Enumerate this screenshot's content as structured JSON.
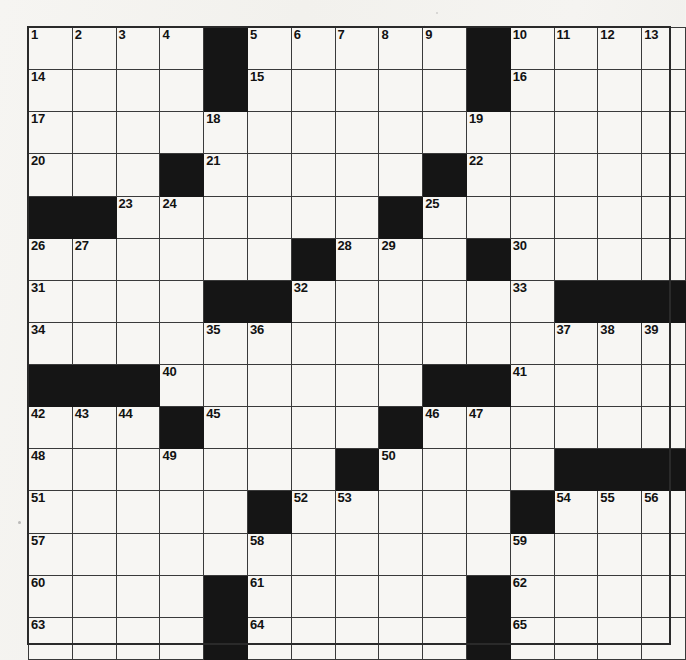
{
  "puzzle": {
    "title": "Crossword Puzzle Grid",
    "rows": 15,
    "columns": 15,
    "cell_fill_color": "#f7f6f3",
    "block_color": "#151515",
    "grid_line_color": "#3a3a3a",
    "number_color": "#121212",
    "paper_color": "#f2f1ed",
    "max_clue_number": 65,
    "grid": [
      [
        {
          "type": "open",
          "number": "1"
        },
        {
          "type": "open",
          "number": "2"
        },
        {
          "type": "open",
          "number": "3"
        },
        {
          "type": "open",
          "number": "4"
        },
        {
          "type": "block",
          "number": ""
        },
        {
          "type": "open",
          "number": "5"
        },
        {
          "type": "open",
          "number": "6"
        },
        {
          "type": "open",
          "number": "7"
        },
        {
          "type": "open",
          "number": "8"
        },
        {
          "type": "open",
          "number": "9"
        },
        {
          "type": "block",
          "number": ""
        },
        {
          "type": "open",
          "number": "10"
        },
        {
          "type": "open",
          "number": "11"
        },
        {
          "type": "open",
          "number": "12"
        },
        {
          "type": "open",
          "number": "13"
        }
      ],
      [
        {
          "type": "open",
          "number": "14"
        },
        {
          "type": "open",
          "number": ""
        },
        {
          "type": "open",
          "number": ""
        },
        {
          "type": "open",
          "number": ""
        },
        {
          "type": "block",
          "number": ""
        },
        {
          "type": "open",
          "number": "15"
        },
        {
          "type": "open",
          "number": ""
        },
        {
          "type": "open",
          "number": ""
        },
        {
          "type": "open",
          "number": ""
        },
        {
          "type": "open",
          "number": ""
        },
        {
          "type": "block",
          "number": ""
        },
        {
          "type": "open",
          "number": "16"
        },
        {
          "type": "open",
          "number": ""
        },
        {
          "type": "open",
          "number": ""
        },
        {
          "type": "open",
          "number": ""
        }
      ],
      [
        {
          "type": "open",
          "number": "17"
        },
        {
          "type": "open",
          "number": ""
        },
        {
          "type": "open",
          "number": ""
        },
        {
          "type": "open",
          "number": ""
        },
        {
          "type": "open",
          "number": "18"
        },
        {
          "type": "open",
          "number": ""
        },
        {
          "type": "open",
          "number": ""
        },
        {
          "type": "open",
          "number": ""
        },
        {
          "type": "open",
          "number": ""
        },
        {
          "type": "open",
          "number": ""
        },
        {
          "type": "open",
          "number": "19"
        },
        {
          "type": "open",
          "number": ""
        },
        {
          "type": "open",
          "number": ""
        },
        {
          "type": "open",
          "number": ""
        },
        {
          "type": "open",
          "number": ""
        }
      ],
      [
        {
          "type": "open",
          "number": "20"
        },
        {
          "type": "open",
          "number": ""
        },
        {
          "type": "open",
          "number": ""
        },
        {
          "type": "block",
          "number": ""
        },
        {
          "type": "open",
          "number": "21"
        },
        {
          "type": "open",
          "number": ""
        },
        {
          "type": "open",
          "number": ""
        },
        {
          "type": "open",
          "number": ""
        },
        {
          "type": "open",
          "number": ""
        },
        {
          "type": "block",
          "number": ""
        },
        {
          "type": "open",
          "number": "22"
        },
        {
          "type": "open",
          "number": ""
        },
        {
          "type": "open",
          "number": ""
        },
        {
          "type": "open",
          "number": ""
        },
        {
          "type": "open",
          "number": ""
        }
      ],
      [
        {
          "type": "block",
          "number": ""
        },
        {
          "type": "block",
          "number": ""
        },
        {
          "type": "open",
          "number": "23"
        },
        {
          "type": "open",
          "number": "24"
        },
        {
          "type": "open",
          "number": ""
        },
        {
          "type": "open",
          "number": ""
        },
        {
          "type": "open",
          "number": ""
        },
        {
          "type": "open",
          "number": ""
        },
        {
          "type": "block",
          "number": ""
        },
        {
          "type": "open",
          "number": "25"
        },
        {
          "type": "open",
          "number": ""
        },
        {
          "type": "open",
          "number": ""
        },
        {
          "type": "open",
          "number": ""
        },
        {
          "type": "open",
          "number": ""
        },
        {
          "type": "open",
          "number": ""
        }
      ],
      [
        {
          "type": "open",
          "number": "26"
        },
        {
          "type": "open",
          "number": "27"
        },
        {
          "type": "open",
          "number": ""
        },
        {
          "type": "open",
          "number": ""
        },
        {
          "type": "open",
          "number": ""
        },
        {
          "type": "open",
          "number": ""
        },
        {
          "type": "block",
          "number": ""
        },
        {
          "type": "open",
          "number": "28"
        },
        {
          "type": "open",
          "number": "29"
        },
        {
          "type": "open",
          "number": ""
        },
        {
          "type": "block",
          "number": ""
        },
        {
          "type": "open",
          "number": "30"
        },
        {
          "type": "open",
          "number": ""
        },
        {
          "type": "open",
          "number": ""
        },
        {
          "type": "open",
          "number": ""
        }
      ],
      [
        {
          "type": "open",
          "number": "31"
        },
        {
          "type": "open",
          "number": ""
        },
        {
          "type": "open",
          "number": ""
        },
        {
          "type": "open",
          "number": ""
        },
        {
          "type": "block",
          "number": ""
        },
        {
          "type": "block",
          "number": ""
        },
        {
          "type": "open",
          "number": "32"
        },
        {
          "type": "open",
          "number": ""
        },
        {
          "type": "open",
          "number": ""
        },
        {
          "type": "open",
          "number": ""
        },
        {
          "type": "open",
          "number": ""
        },
        {
          "type": "open",
          "number": "33"
        },
        {
          "type": "block",
          "number": ""
        },
        {
          "type": "block",
          "number": ""
        },
        {
          "type": "block",
          "number": ""
        }
      ],
      [
        {
          "type": "open",
          "number": "34"
        },
        {
          "type": "open",
          "number": ""
        },
        {
          "type": "open",
          "number": ""
        },
        {
          "type": "open",
          "number": ""
        },
        {
          "type": "open",
          "number": "35"
        },
        {
          "type": "open",
          "number": "36"
        },
        {
          "type": "open",
          "number": ""
        },
        {
          "type": "open",
          "number": ""
        },
        {
          "type": "open",
          "number": ""
        },
        {
          "type": "open",
          "number": ""
        },
        {
          "type": "open",
          "number": ""
        },
        {
          "type": "open",
          "number": ""
        },
        {
          "type": "open",
          "number": "37"
        },
        {
          "type": "open",
          "number": "38"
        },
        {
          "type": "open",
          "number": "39"
        }
      ],
      [
        {
          "type": "block",
          "number": ""
        },
        {
          "type": "block",
          "number": ""
        },
        {
          "type": "block",
          "number": ""
        },
        {
          "type": "open",
          "number": "40"
        },
        {
          "type": "open",
          "number": ""
        },
        {
          "type": "open",
          "number": ""
        },
        {
          "type": "open",
          "number": ""
        },
        {
          "type": "open",
          "number": ""
        },
        {
          "type": "open",
          "number": ""
        },
        {
          "type": "block",
          "number": ""
        },
        {
          "type": "block",
          "number": ""
        },
        {
          "type": "open",
          "number": "41"
        },
        {
          "type": "open",
          "number": ""
        },
        {
          "type": "open",
          "number": ""
        },
        {
          "type": "open",
          "number": ""
        }
      ],
      [
        {
          "type": "open",
          "number": "42"
        },
        {
          "type": "open",
          "number": "43"
        },
        {
          "type": "open",
          "number": "44"
        },
        {
          "type": "block",
          "number": ""
        },
        {
          "type": "open",
          "number": "45"
        },
        {
          "type": "open",
          "number": ""
        },
        {
          "type": "open",
          "number": ""
        },
        {
          "type": "open",
          "number": ""
        },
        {
          "type": "block",
          "number": ""
        },
        {
          "type": "open",
          "number": "46"
        },
        {
          "type": "open",
          "number": "47"
        },
        {
          "type": "open",
          "number": ""
        },
        {
          "type": "open",
          "number": ""
        },
        {
          "type": "open",
          "number": ""
        },
        {
          "type": "open",
          "number": ""
        }
      ],
      [
        {
          "type": "open",
          "number": "48"
        },
        {
          "type": "open",
          "number": ""
        },
        {
          "type": "open",
          "number": ""
        },
        {
          "type": "open",
          "number": "49"
        },
        {
          "type": "open",
          "number": ""
        },
        {
          "type": "open",
          "number": ""
        },
        {
          "type": "open",
          "number": ""
        },
        {
          "type": "block",
          "number": ""
        },
        {
          "type": "open",
          "number": "50"
        },
        {
          "type": "open",
          "number": ""
        },
        {
          "type": "open",
          "number": ""
        },
        {
          "type": "open",
          "number": ""
        },
        {
          "type": "block",
          "number": ""
        },
        {
          "type": "block",
          "number": ""
        },
        {
          "type": "block",
          "number": ""
        }
      ],
      [
        {
          "type": "open",
          "number": "51"
        },
        {
          "type": "open",
          "number": ""
        },
        {
          "type": "open",
          "number": ""
        },
        {
          "type": "open",
          "number": ""
        },
        {
          "type": "open",
          "number": ""
        },
        {
          "type": "block",
          "number": ""
        },
        {
          "type": "open",
          "number": "52"
        },
        {
          "type": "open",
          "number": "53"
        },
        {
          "type": "open",
          "number": ""
        },
        {
          "type": "open",
          "number": ""
        },
        {
          "type": "open",
          "number": ""
        },
        {
          "type": "block",
          "number": ""
        },
        {
          "type": "open",
          "number": "54"
        },
        {
          "type": "open",
          "number": "55"
        },
        {
          "type": "open",
          "number": "56"
        }
      ],
      [
        {
          "type": "open",
          "number": "57"
        },
        {
          "type": "open",
          "number": ""
        },
        {
          "type": "open",
          "number": ""
        },
        {
          "type": "open",
          "number": ""
        },
        {
          "type": "open",
          "number": ""
        },
        {
          "type": "open",
          "number": "58"
        },
        {
          "type": "open",
          "number": ""
        },
        {
          "type": "open",
          "number": ""
        },
        {
          "type": "open",
          "number": ""
        },
        {
          "type": "open",
          "number": ""
        },
        {
          "type": "open",
          "number": ""
        },
        {
          "type": "open",
          "number": "59"
        },
        {
          "type": "open",
          "number": ""
        },
        {
          "type": "open",
          "number": ""
        },
        {
          "type": "open",
          "number": ""
        }
      ],
      [
        {
          "type": "open",
          "number": "60"
        },
        {
          "type": "open",
          "number": ""
        },
        {
          "type": "open",
          "number": ""
        },
        {
          "type": "open",
          "number": ""
        },
        {
          "type": "block",
          "number": ""
        },
        {
          "type": "open",
          "number": "61"
        },
        {
          "type": "open",
          "number": ""
        },
        {
          "type": "open",
          "number": ""
        },
        {
          "type": "open",
          "number": ""
        },
        {
          "type": "open",
          "number": ""
        },
        {
          "type": "block",
          "number": ""
        },
        {
          "type": "open",
          "number": "62"
        },
        {
          "type": "open",
          "number": ""
        },
        {
          "type": "open",
          "number": ""
        },
        {
          "type": "open",
          "number": ""
        }
      ],
      [
        {
          "type": "open",
          "number": "63"
        },
        {
          "type": "open",
          "number": ""
        },
        {
          "type": "open",
          "number": ""
        },
        {
          "type": "open",
          "number": ""
        },
        {
          "type": "block",
          "number": ""
        },
        {
          "type": "open",
          "number": "64"
        },
        {
          "type": "open",
          "number": ""
        },
        {
          "type": "open",
          "number": ""
        },
        {
          "type": "open",
          "number": ""
        },
        {
          "type": "open",
          "number": ""
        },
        {
          "type": "block",
          "number": ""
        },
        {
          "type": "open",
          "number": "65"
        },
        {
          "type": "open",
          "number": ""
        },
        {
          "type": "open",
          "number": ""
        },
        {
          "type": "open",
          "number": ""
        }
      ]
    ]
  }
}
